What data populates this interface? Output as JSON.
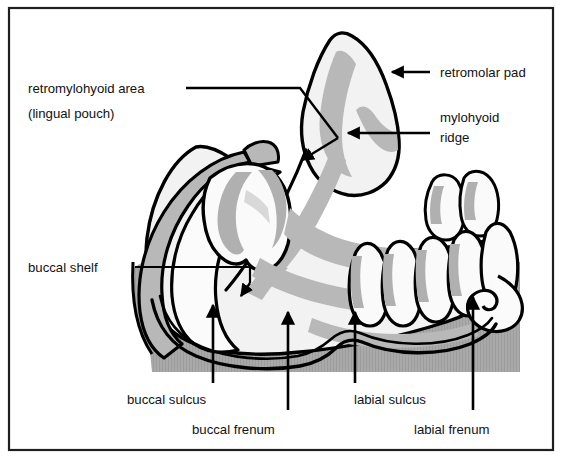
{
  "figure": {
    "frame_color": "#1a1a1a",
    "background_color": "#ffffff",
    "hatch_gray": "#a9a9a9",
    "tissue_gray": "#b3b3b3",
    "bone_light": "#f0f0f0",
    "outline_color": "#000000"
  },
  "labels": {
    "retromylohyoid_line1": "retromylohyoid area",
    "retromylohyoid_line2": "(lingual pouch)",
    "retromolar_pad": "retromolar pad",
    "mylohyoid_line1": "mylohyoid",
    "mylohyoid_line2": "ridge",
    "buccal_shelf": "buccal shelf",
    "buccal_sulcus": "buccal sulcus",
    "buccal_frenum": "buccal frenum",
    "labial_sulcus": "labial sulcus",
    "labial_frenum": "labial frenum"
  }
}
